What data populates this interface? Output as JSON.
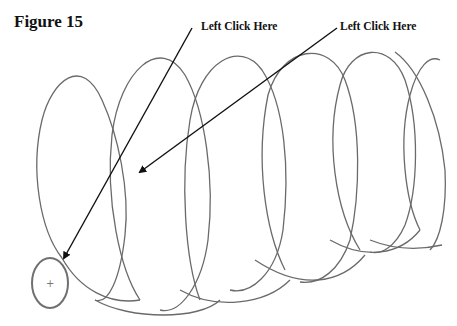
{
  "figure": {
    "title": "Figure 15",
    "annotations": [
      {
        "label": "Left Click Here",
        "target": "profile-circle"
      },
      {
        "label": "Left Click Here",
        "target": "helix-path"
      }
    ],
    "center_mark": "+"
  }
}
